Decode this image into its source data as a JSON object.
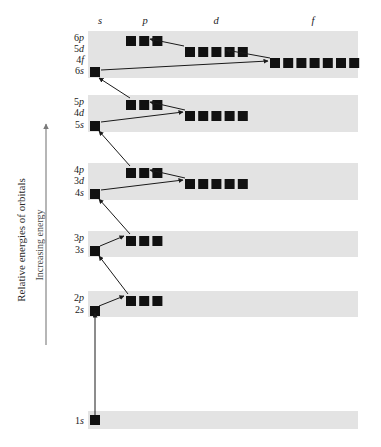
{
  "figure": {
    "axis_title": "Relative energies of orbitals",
    "axis_direction_label": "Increasing energy",
    "column_headers": [
      {
        "name": "s",
        "label": "s",
        "x": 100
      },
      {
        "name": "p",
        "label": "p",
        "x": 145
      },
      {
        "name": "d",
        "label": "d",
        "x": 216
      },
      {
        "name": "f",
        "label": "f",
        "x": 313
      }
    ],
    "colors": {
      "band": "#e3e3e3",
      "box": "#111111",
      "arrow": "#1a1a1a",
      "axis": "#7a7a7a",
      "background": "#ffffff"
    }
  },
  "chart_data": {
    "type": "diagram",
    "title": "Relative energies of orbitals",
    "ylabel": "Increasing energy",
    "xlabel": "",
    "grid": false,
    "legend": "none",
    "subshell_columns": [
      "s",
      "p",
      "d",
      "f"
    ],
    "bands": [
      {
        "name": "band-n6",
        "y": 31,
        "height": 47,
        "rows": [
          {
            "label": "6p",
            "n": 6,
            "subshell": "p",
            "orbitals": 3,
            "label_y": 41,
            "box_y": 36,
            "box_x": 126
          },
          {
            "label": "5d",
            "n": 5,
            "subshell": "d",
            "orbitals": 5,
            "label_y": 52,
            "box_y": 47,
            "box_x": 185
          },
          {
            "label": "4f",
            "n": 4,
            "subshell": "f",
            "orbitals": 7,
            "label_y": 63,
            "box_y": 58,
            "box_x": 270
          },
          {
            "label": "6s",
            "n": 6,
            "subshell": "s",
            "orbitals": 1,
            "label_y": 74,
            "box_y": 67,
            "box_x": 90
          }
        ]
      },
      {
        "name": "band-n5",
        "y": 95,
        "height": 37,
        "rows": [
          {
            "label": "5p",
            "n": 5,
            "subshell": "p",
            "orbitals": 3,
            "label_y": 105,
            "box_y": 100,
            "box_x": 126
          },
          {
            "label": "4d",
            "n": 4,
            "subshell": "d",
            "orbitals": 5,
            "label_y": 116,
            "box_y": 111,
            "box_x": 185
          },
          {
            "label": "5s",
            "n": 5,
            "subshell": "s",
            "orbitals": 1,
            "label_y": 128,
            "box_y": 121,
            "box_x": 90
          }
        ]
      },
      {
        "name": "band-n4",
        "y": 163,
        "height": 37,
        "rows": [
          {
            "label": "4p",
            "n": 4,
            "subshell": "p",
            "orbitals": 3,
            "label_y": 173,
            "box_y": 168,
            "box_x": 126
          },
          {
            "label": "3d",
            "n": 3,
            "subshell": "d",
            "orbitals": 5,
            "label_y": 184,
            "box_y": 179,
            "box_x": 185
          },
          {
            "label": "4s",
            "n": 4,
            "subshell": "s",
            "orbitals": 1,
            "label_y": 196,
            "box_y": 189,
            "box_x": 90
          }
        ]
      },
      {
        "name": "band-n3",
        "y": 231,
        "height": 26,
        "rows": [
          {
            "label": "3p",
            "n": 3,
            "subshell": "p",
            "orbitals": 3,
            "label_y": 241,
            "box_y": 236,
            "box_x": 126
          },
          {
            "label": "3s",
            "n": 3,
            "subshell": "s",
            "orbitals": 1,
            "label_y": 253,
            "box_y": 246,
            "box_x": 90
          }
        ]
      },
      {
        "name": "band-n2",
        "y": 291,
        "height": 26,
        "rows": [
          {
            "label": "2p",
            "n": 2,
            "subshell": "p",
            "orbitals": 3,
            "label_y": 301,
            "box_y": 296,
            "box_x": 126
          },
          {
            "label": "2s",
            "n": 2,
            "subshell": "s",
            "orbitals": 1,
            "label_y": 313,
            "box_y": 306,
            "box_x": 90
          }
        ]
      },
      {
        "name": "band-n1",
        "y": 411,
        "height": 18,
        "rows": [
          {
            "label": "1s",
            "n": 1,
            "subshell": "s",
            "orbitals": 1,
            "label_y": 424,
            "box_y": 415,
            "box_x": 90
          }
        ]
      }
    ],
    "filling_order_arrows": [
      {
        "name": "arrow-1s-to-2s",
        "from": "1s",
        "to": "2s",
        "x1": 95,
        "y1": 415,
        "x2": 95,
        "y2": 313
      },
      {
        "name": "arrow-2s-to-2p",
        "from": "2s",
        "to": "2p",
        "x1": 99,
        "y1": 306,
        "x2": 124,
        "y2": 296
      },
      {
        "name": "arrow-2p-to-3s",
        "from": "2p",
        "to": "3s",
        "x1": 128,
        "y1": 294,
        "x2": 99,
        "y2": 256
      },
      {
        "name": "arrow-3s-to-3p",
        "from": "3s",
        "to": "3p",
        "x1": 100,
        "y1": 246,
        "x2": 124,
        "y2": 236
      },
      {
        "name": "arrow-3p-to-4s",
        "from": "3p",
        "to": "4s",
        "x1": 130,
        "y1": 234,
        "x2": 99,
        "y2": 199
      },
      {
        "name": "arrow-4s-to-3d",
        "from": "4s",
        "to": "3d",
        "x1": 101,
        "y1": 190,
        "x2": 183,
        "y2": 180
      },
      {
        "name": "arrow-3d-to-4p",
        "from": "3d",
        "to": "4p",
        "x1": 185,
        "y1": 178,
        "x2": 150,
        "y2": 170
      },
      {
        "name": "arrow-4p-to-5s",
        "from": "4p",
        "to": "5s",
        "x1": 130,
        "y1": 166,
        "x2": 99,
        "y2": 131
      },
      {
        "name": "arrow-5s-to-4d",
        "from": "5s",
        "to": "4d",
        "x1": 101,
        "y1": 122,
        "x2": 183,
        "y2": 112
      },
      {
        "name": "arrow-4d-to-5p",
        "from": "4d",
        "to": "5p",
        "x1": 185,
        "y1": 110,
        "x2": 150,
        "y2": 102
      },
      {
        "name": "arrow-5p-to-6s",
        "from": "5p",
        "to": "6s",
        "x1": 130,
        "y1": 98,
        "x2": 99,
        "y2": 78
      },
      {
        "name": "arrow-6s-to-4f",
        "from": "6s",
        "to": "4f",
        "x1": 101,
        "y1": 70,
        "x2": 268,
        "y2": 61
      },
      {
        "name": "arrow-4f-to-5d",
        "from": "4f",
        "to": "5d",
        "x1": 270,
        "y1": 58,
        "x2": 226,
        "y2": 50
      },
      {
        "name": "arrow-5d-to-6p",
        "from": "5d",
        "to": "6p",
        "x1": 184,
        "y1": 46,
        "x2": 150,
        "y2": 39
      }
    ]
  }
}
